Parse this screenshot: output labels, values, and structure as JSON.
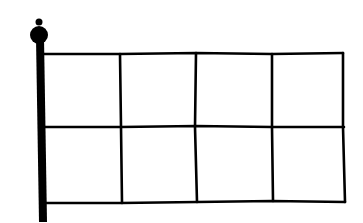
{
  "drawing": {
    "subject": "flag-on-pole",
    "line_color": "#000000",
    "background": "#ffffff",
    "grid": {
      "columns": 4,
      "rows": 2
    }
  }
}
